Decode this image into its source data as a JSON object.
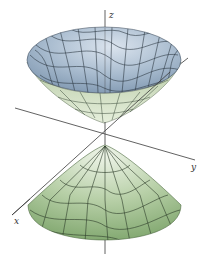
{
  "figure": {
    "axes": {
      "x_label": "x",
      "y_label": "y",
      "z_label": "z"
    },
    "colors": {
      "upper_cone_inner": "#9fb3c8",
      "upper_cone_inner_light": "#d2dde8",
      "upper_cone_outer": "#c9d9b8",
      "lower_cone_dark": "#7fa56f",
      "lower_cone_light": "#e4eedc",
      "mesh": "#2f3a34",
      "axis": "#3a3a3a"
    }
  }
}
